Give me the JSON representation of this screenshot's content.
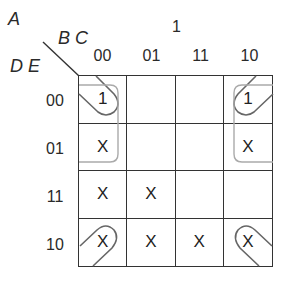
{
  "labels": {
    "a": "A",
    "bc": "B C",
    "de": "D E",
    "a_value": "1"
  },
  "columns": [
    "00",
    "01",
    "11",
    "10"
  ],
  "rows": [
    {
      "label": "00",
      "cells": [
        "1",
        "",
        "",
        "1"
      ]
    },
    {
      "label": "01",
      "cells": [
        "X",
        "",
        "",
        "X"
      ]
    },
    {
      "label": "11",
      "cells": [
        "X",
        "X",
        "",
        ""
      ]
    },
    {
      "label": "10",
      "cells": [
        "X",
        "X",
        "X",
        "X"
      ]
    }
  ],
  "groupings": [
    {
      "name": "corner-loop-rows-00-10",
      "cells": [
        "00/00",
        "00/10",
        "10/00",
        "10/10"
      ]
    },
    {
      "name": "corner-loop-rows-00-01",
      "cells": [
        "00/00",
        "01/00",
        "00/10",
        "01/10"
      ]
    }
  ]
}
